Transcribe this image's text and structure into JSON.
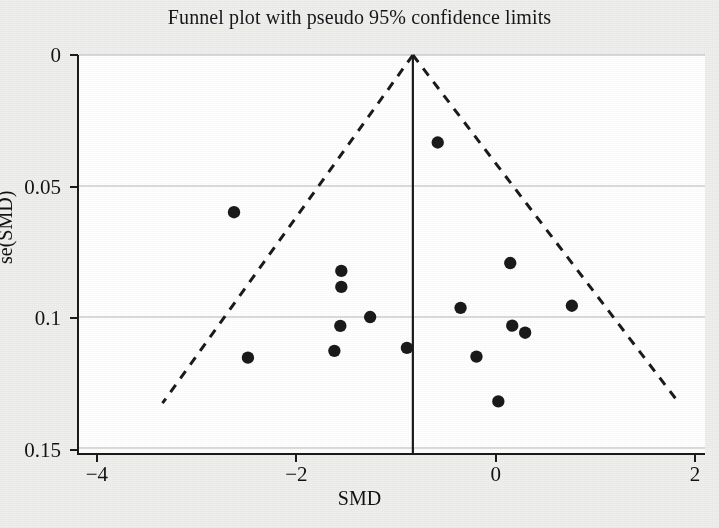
{
  "chart_data": {
    "type": "scatter",
    "title": "Funnel plot with pseudo 95% confidence limits",
    "xlabel": "SMD",
    "ylabel": "se(SMD)",
    "xlim": [
      -4.2,
      2.1
    ],
    "ylim": [
      0,
      0.1519
    ],
    "y_inverted": true,
    "grid": "horizontal",
    "xticks": [
      -4,
      -2,
      0,
      2
    ],
    "xtick_labels": [
      "-4",
      "-2",
      "0",
      "2"
    ],
    "yticks": [
      0,
      0.05,
      0.1,
      0.15
    ],
    "ytick_labels": [
      "0",
      "0.05",
      "0.1",
      "0.15"
    ],
    "legend": null,
    "reference_line": {
      "type": "vertical",
      "label": "pooled SMD",
      "x": -0.84,
      "y_from": 0,
      "y_to": 0.1519
    },
    "pseudo_ci_limits": {
      "style": "dashed",
      "apex": {
        "x": -0.84,
        "se": 0
      },
      "left_end": {
        "x": -3.36,
        "se": 0.1329
      },
      "right_end": {
        "x": 1.84,
        "se": 0.1329
      }
    },
    "series": [
      {
        "name": "studies",
        "marker": "filled-circle",
        "color": "#1a1a1a",
        "points": [
          {
            "x": -2.64,
            "se": 0.06
          },
          {
            "x": -0.59,
            "se": 0.0334
          },
          {
            "x": -1.56,
            "se": 0.0824
          },
          {
            "x": -1.56,
            "se": 0.0885
          },
          {
            "x": 0.14,
            "se": 0.0794
          },
          {
            "x": -0.36,
            "se": 0.0965
          },
          {
            "x": -1.27,
            "se": 0.1
          },
          {
            "x": -1.57,
            "se": 0.1034
          },
          {
            "x": 0.76,
            "se": 0.0957
          },
          {
            "x": 0.16,
            "se": 0.1033
          },
          {
            "x": 0.29,
            "se": 0.106
          },
          {
            "x": -0.9,
            "se": 0.1118
          },
          {
            "x": -1.63,
            "se": 0.1129
          },
          {
            "x": -2.5,
            "se": 0.1155
          },
          {
            "x": -0.2,
            "se": 0.1151
          },
          {
            "x": 0.02,
            "se": 0.1322
          }
        ]
      }
    ]
  }
}
